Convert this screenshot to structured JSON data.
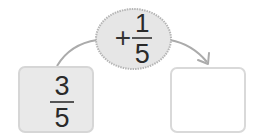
{
  "diagram": {
    "start_box": {
      "numerator": "3",
      "denominator": "5"
    },
    "operation": {
      "operator": "+",
      "numerator": "1",
      "denominator": "5"
    },
    "result_box": {
      "value": ""
    },
    "colors": {
      "start_fill": "#e9e9e9",
      "operation_fill": "#e6e6e6",
      "border": "#d6d6d6",
      "arrow": "#a8a8a8"
    }
  }
}
